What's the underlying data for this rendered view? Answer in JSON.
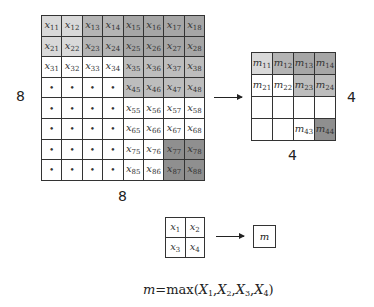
{
  "input": {
    "rows_label": "8",
    "cols_label": "8",
    "cells": [
      [
        "x11",
        "x12",
        "x13",
        "x14",
        "x15",
        "x16",
        "x17",
        "x18"
      ],
      [
        "x21",
        "x22",
        "x23",
        "x24",
        "x25",
        "x26",
        "x27",
        "x28"
      ],
      [
        "x31",
        "x32",
        "x33",
        "x34",
        "x35",
        "x36",
        "x37",
        "x38"
      ],
      [
        "•",
        "•",
        "•",
        "•",
        "x45",
        "x46",
        "x47",
        "x48"
      ],
      [
        "•",
        "•",
        "•",
        "•",
        "x55",
        "x56",
        "x57",
        "x58"
      ],
      [
        "•",
        "•",
        "•",
        "•",
        "x65",
        "x66",
        "x67",
        "x68"
      ],
      [
        "•",
        "•",
        "•",
        "•",
        "x75",
        "x76",
        "x77",
        "x78"
      ],
      [
        "•",
        "•",
        "•",
        "•",
        "x85",
        "x86",
        "x87",
        "x88"
      ]
    ],
    "shades": [
      [
        "#d9d9d9",
        "#d9d9d9",
        "#b4b4b4",
        "#b4b4b4",
        "#a6a6a6",
        "#a6a6a6",
        "#a6a6a6",
        "#a6a6a6"
      ],
      [
        "#d9d9d9",
        "#d9d9d9",
        "#b4b4b4",
        "#b4b4b4",
        "#a6a6a6",
        "#a6a6a6",
        "#a6a6a6",
        "#a6a6a6"
      ],
      [
        "#ffffff",
        "#ffffff",
        "#ffffff",
        "#ffffff",
        "#bdbdbd",
        "#bdbdbd",
        "#bdbdbd",
        "#bdbdbd"
      ],
      [
        "#ffffff",
        "#ffffff",
        "#ffffff",
        "#ffffff",
        "#bdbdbd",
        "#bdbdbd",
        "#bdbdbd",
        "#bdbdbd"
      ],
      [
        "#ffffff",
        "#ffffff",
        "#ffffff",
        "#ffffff",
        "#ffffff",
        "#ffffff",
        "#ffffff",
        "#ffffff"
      ],
      [
        "#ffffff",
        "#ffffff",
        "#ffffff",
        "#ffffff",
        "#ffffff",
        "#ffffff",
        "#ffffff",
        "#ffffff"
      ],
      [
        "#ffffff",
        "#ffffff",
        "#ffffff",
        "#ffffff",
        "#ffffff",
        "#ffffff",
        "#8f8f8f",
        "#8f8f8f"
      ],
      [
        "#ffffff",
        "#ffffff",
        "#ffffff",
        "#ffffff",
        "#ffffff",
        "#ffffff",
        "#8f8f8f",
        "#8f8f8f"
      ]
    ]
  },
  "output": {
    "rows_label": "4",
    "cols_label": "4",
    "cells": [
      [
        "m11",
        "m12",
        "m13",
        "m14"
      ],
      [
        "m21",
        "m22",
        "m23",
        "m24"
      ],
      [
        "",
        "",
        "",
        ""
      ],
      [
        "",
        "",
        "m43",
        "m44"
      ]
    ],
    "shades": [
      [
        "#d9d9d9",
        "#b4b4b4",
        "#a6a6a6",
        "#a6a6a6"
      ],
      [
        "#ffffff",
        "#ffffff",
        "#bdbdbd",
        "#bdbdbd"
      ],
      [
        "#ffffff",
        "#ffffff",
        "#ffffff",
        "#ffffff"
      ],
      [
        "#ffffff",
        "#ffffff",
        "#ffffff",
        "#8f8f8f"
      ]
    ]
  },
  "example": {
    "cells": [
      [
        "x1",
        "x2"
      ],
      [
        "x3",
        "x4"
      ]
    ],
    "result": "m"
  },
  "formula": {
    "lhs": "m",
    "eq": "=",
    "fn": "max",
    "args": [
      "X1",
      "X2",
      "X3",
      "X4"
    ]
  }
}
